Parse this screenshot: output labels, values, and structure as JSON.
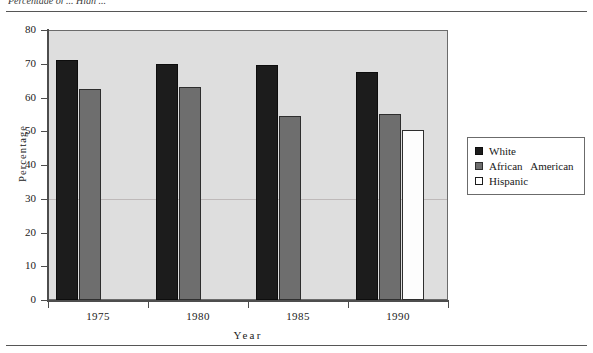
{
  "caption": "Percentage of ... High ...",
  "chart_data": {
    "type": "bar",
    "title": "",
    "xlabel": "Year",
    "ylabel": "Percentage",
    "categories": [
      "1975",
      "1980",
      "1985",
      "1990"
    ],
    "series": [
      {
        "name": "White",
        "color": "#1c1c1c",
        "values": [
          71,
          70,
          69.5,
          67.5
        ]
      },
      {
        "name": "African   American",
        "color": "#6e6e6e",
        "values": [
          62.5,
          63,
          54.5,
          55
        ]
      },
      {
        "name": "Hispanic",
        "color": "#ffffff",
        "values": [
          null,
          null,
          null,
          50.5
        ]
      }
    ],
    "ylim": [
      0,
      80
    ],
    "yticks": [
      0,
      10,
      20,
      30,
      40,
      50,
      60,
      70,
      80
    ],
    "ytick_labels": [
      "0",
      "10",
      "20",
      "30",
      "40",
      "50",
      "60",
      "70",
      "80"
    ],
    "grid": false,
    "legend_position": "right",
    "plot_background": "#dedede"
  },
  "legend": {
    "items": [
      {
        "label": "White",
        "swatch": "black-filled-square"
      },
      {
        "label": "African   American",
        "swatch": "gray-filled-square"
      },
      {
        "label": "Hispanic",
        "swatch": "white-hollow-square"
      }
    ]
  }
}
